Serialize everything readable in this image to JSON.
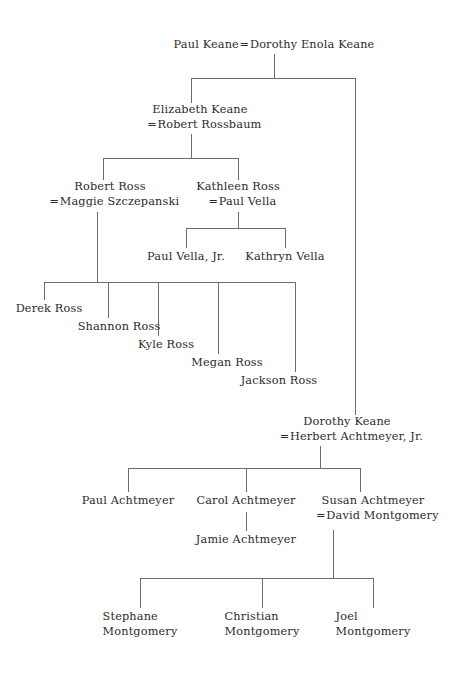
{
  "diagram": {
    "type": "family-tree",
    "background_color": "#ffffff",
    "text_color": "#2b2b2b",
    "line_color": "#6e6e6e",
    "marriage_symbol": "="
  },
  "generations": [
    {
      "id": "gen1",
      "couples": [
        {
          "id": "paul-keane-couple",
          "person": "Paul Keane",
          "symbol": "=",
          "spouse": "Dorothy Enola Keane"
        }
      ]
    },
    {
      "id": "gen2",
      "couples": [
        {
          "id": "elizabeth-keane-couple",
          "person": "Elizabeth Keane",
          "symbol": "=",
          "spouse": "Robert Rossbaum"
        },
        {
          "id": "dorothy-keane-couple",
          "person": "Dorothy Keane",
          "symbol": "=",
          "spouse": "Herbert Achtmeyer, Jr."
        }
      ]
    },
    {
      "id": "gen3",
      "couples": [
        {
          "id": "robert-ross-couple",
          "person": "Robert Ross",
          "symbol": "=",
          "spouse": "Maggie Szczepanski"
        },
        {
          "id": "kathleen-ross-couple",
          "person": "Kathleen Ross",
          "symbol": "=",
          "spouse": "Paul Vella"
        },
        {
          "id": "susan-achtmeyer-couple",
          "person": "Susan Achtmeyer",
          "symbol": "=",
          "spouse": "David Montgomery"
        }
      ],
      "individuals": [
        {
          "id": "paul-achtmeyer",
          "name": "Paul Achtmeyer"
        },
        {
          "id": "carol-achtmeyer",
          "name": "Carol Achtmeyer"
        }
      ]
    },
    {
      "id": "gen4",
      "individuals": [
        {
          "id": "paul-vella-jr",
          "name": "Paul Vella, Jr."
        },
        {
          "id": "kathryn-vella",
          "name": "Kathryn Vella"
        },
        {
          "id": "derek-ross",
          "name": "Derek Ross"
        },
        {
          "id": "shannon-ross",
          "name": "Shannon Ross"
        },
        {
          "id": "kyle-ross",
          "name": "Kyle Ross"
        },
        {
          "id": "megan-ross",
          "name": "Megan Ross"
        },
        {
          "id": "jackson-ross",
          "name": "Jackson Ross"
        },
        {
          "id": "jamie-achtmeyer",
          "name": "Jamie Achtmeyer"
        },
        {
          "id": "stephane-montgomery",
          "name_line1": "Stephane",
          "name_line2": "Montgomery"
        },
        {
          "id": "christian-montgomery",
          "name_line1": "Christian",
          "name_line2": "Montgomery"
        },
        {
          "id": "joel-montgomery",
          "name_line1": "Joel",
          "name_line2": "Montgomery"
        }
      ]
    }
  ],
  "labels": {
    "paul_keane": "Paul Keane",
    "dorothy_enola_keane": "Dorothy Enola Keane",
    "elizabeth_keane": "Elizabeth Keane",
    "robert_rossbaum": "Robert Rossbaum",
    "robert_ross": "Robert Ross",
    "maggie_szczepanski": "Maggie Szczepanski",
    "kathleen_ross": "Kathleen Ross",
    "paul_vella": "Paul Vella",
    "paul_vella_jr": "Paul Vella, Jr.",
    "kathryn_vella": "Kathryn Vella",
    "derek_ross": "Derek Ross",
    "shannon_ross": "Shannon Ross",
    "kyle_ross": "Kyle Ross",
    "megan_ross": "Megan Ross",
    "jackson_ross": "Jackson Ross",
    "dorothy_keane": "Dorothy Keane",
    "herbert_achtmeyer_jr": "Herbert Achtmeyer, Jr.",
    "paul_achtmeyer": "Paul Achtmeyer",
    "carol_achtmeyer": "Carol Achtmeyer",
    "jamie_achtmeyer": "Jamie Achtmeyer",
    "susan_achtmeyer": "Susan Achtmeyer",
    "david_montgomery": "David Montgomery",
    "stephane_1": "Stephane",
    "stephane_2": "Montgomery",
    "christian_1": "Christian",
    "christian_2": "Montgomery",
    "joel_1": "Joel",
    "joel_2": "Montgomery",
    "eq": "="
  }
}
